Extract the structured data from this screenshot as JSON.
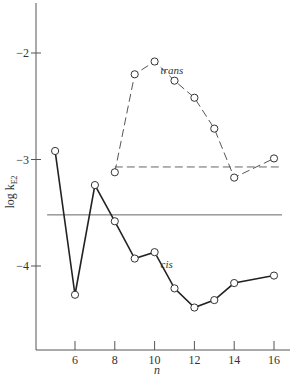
{
  "chart_data": {
    "type": "line",
    "title": "",
    "xlabel": "n",
    "ylabel": "log k_E2",
    "ylabel_main": "log k",
    "ylabel_sub": "E2",
    "xlim": [
      4.0,
      17.0
    ],
    "ylim": [
      -4.8,
      -1.3
    ],
    "xticks": [
      6,
      8,
      10,
      12,
      14,
      16
    ],
    "xtick_labels": [
      "6",
      "8",
      "10",
      "12",
      "14",
      "16"
    ],
    "yticks": [
      -2,
      -3,
      -4
    ],
    "ytick_labels": [
      "−2",
      "−3",
      "−4"
    ],
    "grid": false,
    "legend": "inline labels",
    "series": [
      {
        "name": "trans",
        "style": "dashed",
        "marker": "open-circle",
        "x": [
          8,
          9,
          10,
          11,
          12,
          13,
          14,
          16
        ],
        "values": [
          -3.12,
          -2.2,
          -2.08,
          -2.26,
          -2.42,
          -2.71,
          -3.17,
          -2.99
        ]
      },
      {
        "name": "cis",
        "style": "solid",
        "marker": "open-circle",
        "x": [
          5,
          6,
          7,
          8,
          9,
          10,
          11,
          12,
          13,
          14,
          16
        ],
        "values": [
          -2.92,
          -4.27,
          -3.24,
          -3.58,
          -3.93,
          -3.87,
          -4.21,
          -4.39,
          -4.32,
          -4.16,
          -4.09
        ]
      }
    ],
    "reference_lines": [
      {
        "name": "trans-reference",
        "style": "dashed",
        "y": -3.07,
        "x_range": [
          8,
          16.4
        ]
      },
      {
        "name": "cis-reference",
        "style": "solid",
        "y": -3.52,
        "x_range": [
          4.6,
          16.4
        ]
      }
    ],
    "annotations": [
      {
        "text": "trans",
        "near_x": 10.3,
        "near_y": -2.2
      },
      {
        "text": "cis",
        "near_x": 10.3,
        "near_y": -4.02
      }
    ]
  }
}
